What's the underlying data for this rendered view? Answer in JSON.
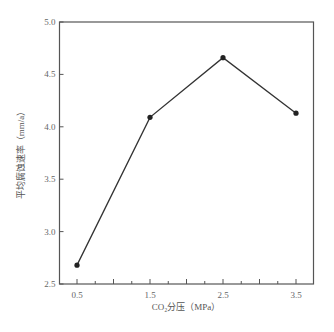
{
  "chart_data": {
    "type": "line",
    "title": "",
    "xlabel": "CO₂分压（MPa）",
    "ylabel": "平均腐蚀速率（mm/a）",
    "x": [
      0.5,
      1.5,
      2.5,
      3.5
    ],
    "values": [
      2.68,
      4.09,
      4.66,
      4.13
    ],
    "series": [
      {
        "name": "平均腐蚀速率",
        "x": [
          0.5,
          1.5,
          2.5,
          3.5
        ],
        "values": [
          2.68,
          4.09,
          4.66,
          4.13
        ]
      }
    ],
    "xlim": [
      0.25,
      3.65
    ],
    "ylim": [
      2.5,
      5.0
    ],
    "x_tick_labels": [
      "0.5",
      "1.5",
      "2.5",
      "3.5"
    ],
    "y_tick_labels": [
      "2.5",
      "3.0",
      "3.5",
      "4.0",
      "4.5",
      "5.0"
    ],
    "grid": false,
    "legend": "none",
    "line_color": "#333333",
    "marker": "circle"
  }
}
